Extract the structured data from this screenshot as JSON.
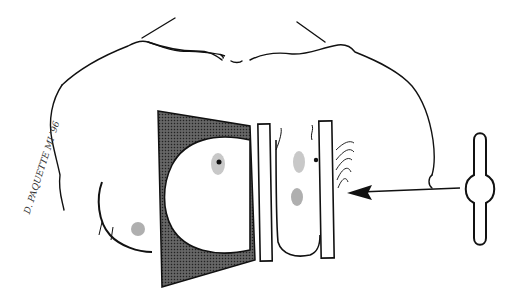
{
  "illustration": {
    "subject": "breast compression between paddles with x-ray source",
    "signature": "D. PAQUETTE MI '96",
    "colors": {
      "line": "#111111",
      "detector_fill": "#4a4a4a",
      "paddle_fill": "#ffffff",
      "areola_gray": "#c8c8c8",
      "background": "#ffffff"
    }
  }
}
